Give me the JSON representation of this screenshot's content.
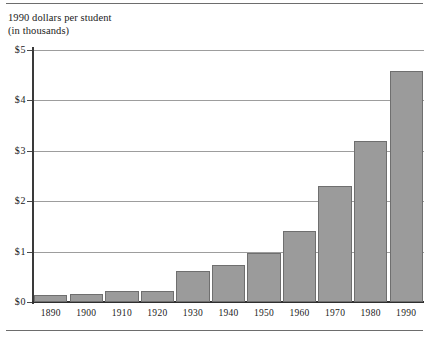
{
  "figure": {
    "caption_line1": "1990 dollars per student",
    "caption_line2": "(in thousands)",
    "bar_color": "#9b9b9b",
    "bar_edge_color": "#6f6f6f",
    "grid_color": "#9d9d9d",
    "axis_color": "#2f2f2f"
  },
  "chart_data": {
    "type": "bar",
    "title": "1990 dollars per student (in thousands)",
    "xlabel": "",
    "ylabel": "1990 dollars per student (in thousands)",
    "categories": [
      "1890",
      "1900",
      "1910",
      "1920",
      "1930",
      "1940",
      "1950",
      "1960",
      "1970",
      "1980",
      "1990"
    ],
    "values": [
      0.14,
      0.16,
      0.22,
      0.21,
      0.61,
      0.74,
      0.97,
      1.4,
      2.3,
      3.19,
      4.58
    ],
    "ylim": [
      0,
      5
    ],
    "ytick_values": [
      0,
      1,
      2,
      3,
      4,
      5
    ],
    "ytick_labels": [
      "$0",
      "$1",
      "$2",
      "$3",
      "$4",
      "$5"
    ],
    "grid": "horizontal",
    "legend": "none"
  }
}
